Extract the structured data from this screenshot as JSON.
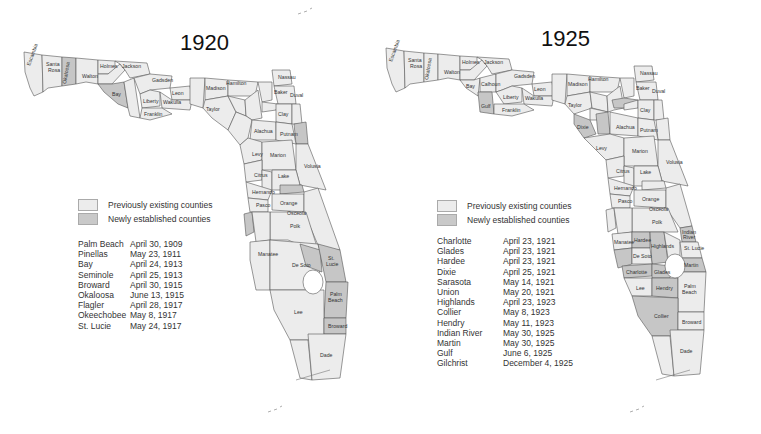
{
  "maps": [
    {
      "year": "1920",
      "legend": {
        "previous": "Previously existing counties",
        "new": "Newly established counties"
      },
      "new_counties": [
        {
          "name": "Palm Beach",
          "date": "April 30, 1909"
        },
        {
          "name": "Pinellas",
          "date": "May 23, 1911"
        },
        {
          "name": "Bay",
          "date": "April 24, 1913"
        },
        {
          "name": "Seminole",
          "date": "April 25, 1913"
        },
        {
          "name": "Broward",
          "date": "April 30, 1915"
        },
        {
          "name": "Okaloosa",
          "date": "June 13, 1915"
        },
        {
          "name": "Flagler",
          "date": "April 28, 1917"
        },
        {
          "name": "Okeechobee",
          "date": "May 8, 1917"
        },
        {
          "name": "St. Lucie",
          "date": "May 24, 1917"
        }
      ],
      "county_labels": [
        "Escambia",
        "Santa Rosa",
        "Okaloosa",
        "Walton",
        "Holmes",
        "Washington",
        "Jackson",
        "Bay",
        "Calhoun",
        "Gadsden",
        "Liberty",
        "Leon",
        "Wakulla",
        "Franklin",
        "Jefferson",
        "Madison",
        "Hamilton",
        "Taylor",
        "Suwannee",
        "Columbia",
        "Baker",
        "Nassau",
        "Duval",
        "Bradford",
        "Clay",
        "St. Johns",
        "Lafayette",
        "Alachua",
        "Putnam",
        "Flagler",
        "Levy",
        "Marion",
        "Volusia",
        "Citrus",
        "Sumter",
        "Lake",
        "Seminole",
        "Hernando",
        "Orange",
        "Brevard",
        "Pasco",
        "Osceola",
        "Pinellas",
        "Hillsborough",
        "Polk",
        "St. Lucie",
        "Okeechobee",
        "Manatee",
        "De Soto",
        "Palm Beach",
        "Lee",
        "Broward",
        "Monroe",
        "Dade"
      ]
    },
    {
      "year": "1925",
      "legend": {
        "previous": "Previously existing counties",
        "new": "Newly established counties"
      },
      "new_counties": [
        {
          "name": "Charlotte",
          "date": "April 23, 1921"
        },
        {
          "name": "Glades",
          "date": "April 23, 1921"
        },
        {
          "name": "Hardee",
          "date": "April 23, 1921"
        },
        {
          "name": "Dixie",
          "date": "April 25, 1921"
        },
        {
          "name": "Sarasota",
          "date": "May 14, 1921"
        },
        {
          "name": "Union",
          "date": "May 20, 1921"
        },
        {
          "name": "Highlands",
          "date": "April 23, 1923"
        },
        {
          "name": "Collier",
          "date": "May 8, 1923"
        },
        {
          "name": "Hendry",
          "date": "May 11, 1923"
        },
        {
          "name": "Indian River",
          "date": "May 30, 1925"
        },
        {
          "name": "Martin",
          "date": "May 30, 1925"
        },
        {
          "name": "Gulf",
          "date": "June 6, 1925"
        },
        {
          "name": "Gilchrist",
          "date": "December 4, 1925"
        }
      ],
      "county_labels": [
        "Escambia",
        "Santa Rosa",
        "Okaloosa",
        "Walton",
        "Holmes",
        "Washington",
        "Jackson",
        "Bay",
        "Calhoun",
        "Gulf",
        "Gadsden",
        "Liberty",
        "Leon",
        "Wakulla",
        "Franklin",
        "Jefferson",
        "Madison",
        "Hamilton",
        "Taylor",
        "Suwannee",
        "Columbia",
        "Baker",
        "Nassau",
        "Duval",
        "Union",
        "Bradford",
        "Clay",
        "St. Johns",
        "Lafayette",
        "Dixie",
        "Gilchrist",
        "Alachua",
        "Putnam",
        "Flagler",
        "Levy",
        "Marion",
        "Volusia",
        "Citrus",
        "Sumter",
        "Lake",
        "Seminole",
        "Hernando",
        "Orange",
        "Brevard",
        "Pasco",
        "Osceola",
        "Pinellas",
        "Hillsborough",
        "Polk",
        "Indian River",
        "Manatee",
        "Hardee",
        "Highlands",
        "Okeechobee",
        "St. Lucie",
        "Sarasota",
        "De Soto",
        "Martin",
        "Charlotte",
        "Glades",
        "Lee",
        "Hendry",
        "Palm Beach",
        "Collier",
        "Broward",
        "Monroe",
        "Dade"
      ]
    }
  ],
  "colors": {
    "previous_fill": "#ececec",
    "new_fill": "#c6c6c6",
    "border": "#555555"
  }
}
